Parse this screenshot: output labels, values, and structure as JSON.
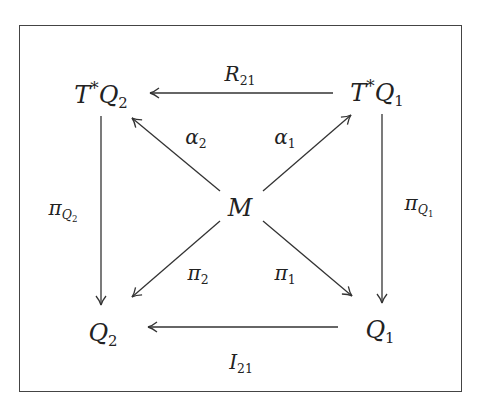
{
  "diagram": {
    "type": "commutative-diagram",
    "nodes": {
      "TQ2": {
        "base": "T",
        "sup": "*",
        "name": "Q",
        "sub": "2",
        "x": 105,
        "y": 94
      },
      "TQ1": {
        "base": "T",
        "sup": "*",
        "name": "Q",
        "sub": "1",
        "x": 378,
        "y": 94
      },
      "M": {
        "name": "M",
        "x": 240,
        "y": 208
      },
      "Q2": {
        "name": "Q",
        "sub": "2",
        "x": 103,
        "y": 333
      },
      "Q1": {
        "name": "Q",
        "sub": "1",
        "x": 375,
        "y": 333
      }
    },
    "edges": {
      "R21": {
        "from": "TQ1",
        "to": "TQ2",
        "name": "R",
        "sub": "21"
      },
      "I21": {
        "from": "Q1",
        "to": "Q2",
        "name": "I",
        "sub": "21"
      },
      "alpha2": {
        "from": "M",
        "to": "TQ2",
        "name": "α",
        "sub": "2"
      },
      "alpha1": {
        "from": "M",
        "to": "TQ1",
        "name": "α",
        "sub": "1"
      },
      "pi2": {
        "from": "M",
        "to": "Q2",
        "name": "π",
        "sub": "2"
      },
      "pi1": {
        "from": "M",
        "to": "Q1",
        "name": "π",
        "sub": "1"
      },
      "piQ2": {
        "from": "TQ2",
        "to": "Q2",
        "name": "π",
        "sub": "Q",
        "subsub": "2"
      },
      "piQ1": {
        "from": "TQ1",
        "to": "Q1",
        "name": "π",
        "sub": "Q",
        "subsub": "1"
      }
    },
    "colors": {
      "stroke": "#333333",
      "frame": "#444444",
      "text": "#222222"
    }
  }
}
